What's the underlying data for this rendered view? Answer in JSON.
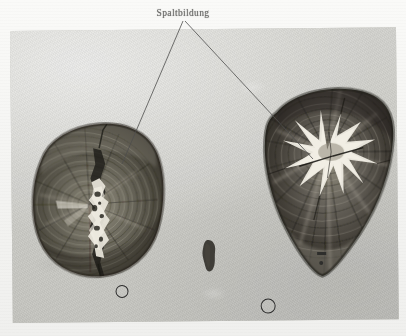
{
  "figure": {
    "caption_label": "Spaltbildung",
    "caption_icon": "text-label",
    "leader_count": 2,
    "plate": {
      "kind": "photographic-plate",
      "background_tone": "#cdcdc8",
      "frame": {
        "x": 10,
        "y": 31,
        "width": 386,
        "height": 292,
        "rotation_deg": -0.55
      }
    },
    "specimens": [
      {
        "name": "left-wood-cross-section",
        "shape": "rounded-trapezoid",
        "tone_dark": "#3a372f",
        "tone_mid": "#6d6a5e",
        "tone_light": "#b4b0a4",
        "split": {
          "name": "radial-split",
          "label": "Spaltbildung",
          "orientation": "vertical",
          "fill": "#e9e6dc"
        },
        "bounds": {
          "x": 18,
          "y": 114,
          "width": 132,
          "height": 152
        }
      },
      {
        "name": "right-wood-cross-section",
        "shape": "inverted-triangle-wedge",
        "tone_dark": "#332f28",
        "tone_mid": "#67635a",
        "tone_light": "#b8b4a8",
        "split": {
          "name": "star-split",
          "label": "Spaltbildung",
          "orientation": "radial-star",
          "fill": "#efece2"
        },
        "bounds": {
          "x": 245,
          "y": 88,
          "width": 142,
          "height": 182
        }
      }
    ],
    "markers": [
      {
        "name": "reference-ring-left",
        "type": "ring",
        "x": 119,
        "y": 295,
        "diameter": 11
      },
      {
        "name": "reference-ring-right",
        "type": "ring",
        "x": 261,
        "y": 309,
        "diameter": 13
      },
      {
        "name": "wood-fragment",
        "type": "chip",
        "x": 196,
        "y": 243,
        "width": 16,
        "height": 30
      },
      {
        "name": "scale-tick",
        "type": "tick",
        "x": 317,
        "y": 263,
        "width": 9,
        "height": 3
      },
      {
        "name": "scale-dot",
        "type": "dot",
        "x": 320,
        "y": 272,
        "diameter": 4
      }
    ],
    "leaders": [
      {
        "name": "leader-line-left",
        "from_x": 183,
        "from_y": 21,
        "to_x": 122,
        "to_y": 163
      },
      {
        "name": "leader-line-right",
        "from_x": 185,
        "from_y": 21,
        "to_x": 312,
        "to_y": 158
      }
    ]
  }
}
